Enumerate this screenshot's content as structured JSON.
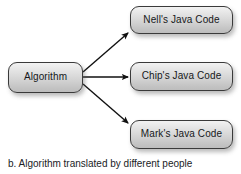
{
  "figure": {
    "caption": "b. Algorithm translated by different people",
    "background_color": "#ffffff",
    "node_fill_top": "#f2f2f2",
    "node_fill_bottom": "#bdbdbd",
    "node_border_color": "#3a3a3a",
    "arrow_color": "#111111",
    "text_color": "#16181a"
  },
  "nodes": {
    "source": {
      "label": "Algorithm"
    },
    "targets": [
      {
        "label": "Nell's Java Code"
      },
      {
        "label": "Chip's Java Code"
      },
      {
        "label": "Mark's Java Code"
      }
    ]
  },
  "connectors": [
    {
      "name": "algorithm-to-nell",
      "direction": "up-right"
    },
    {
      "name": "algorithm-to-chip",
      "direction": "right"
    },
    {
      "name": "algorithm-to-mark",
      "direction": "down-right"
    }
  ]
}
